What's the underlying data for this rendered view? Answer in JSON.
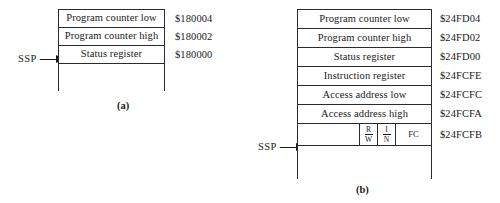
{
  "figure": {
    "panels": [
      {
        "caption": "(a)",
        "pointer_label": "SSP",
        "rows": [
          {
            "label": "Program counter low",
            "address": "$180004"
          },
          {
            "label": "Program counter high",
            "address": "$180002"
          },
          {
            "label": "Status register",
            "address": "$180000"
          },
          {
            "label": "",
            "address": ""
          }
        ]
      },
      {
        "caption": "(b)",
        "pointer_label": "SSP",
        "rows": [
          {
            "label": "Program counter low",
            "address": "$24FD04"
          },
          {
            "label": "Program counter high",
            "address": "$24FD02"
          },
          {
            "label": "Status register",
            "address": "$24FD00"
          },
          {
            "label": "Instruction register",
            "address": "$24FCFE"
          },
          {
            "label": "Access address low",
            "address": "$24FCFC"
          },
          {
            "label": "Access address high",
            "address": "$24FCFA"
          },
          {
            "label": "",
            "address": "$24FCFB"
          },
          {
            "label": "",
            "address": ""
          }
        ],
        "flag_cells": [
          {
            "top": "R",
            "bottom": "W"
          },
          {
            "top": "I",
            "bottom": "N"
          }
        ],
        "fc_label": "FC"
      }
    ]
  },
  "colors": {
    "line": "#2b2b2b",
    "text": "#1a1a1a",
    "background": "#ffffff"
  }
}
